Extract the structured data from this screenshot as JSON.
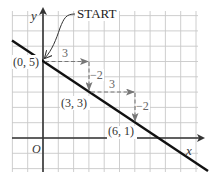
{
  "diagram": {
    "type": "coordinate-plane-slope",
    "axes": {
      "x_label": "x",
      "y_label": "y",
      "origin_label": "O"
    },
    "grid": {
      "unit_px": 15.3,
      "origin_px": [
        43,
        138
      ],
      "x_range": [
        -2,
        10
      ],
      "y_range": [
        -2,
        8
      ]
    },
    "line": {
      "slope": "-2/3",
      "y_intercept": 5,
      "color": "#111111"
    },
    "start_label": "START",
    "points": [
      {
        "label": "(0, 5)",
        "x": 0,
        "y": 5
      },
      {
        "label": "(3, 3)",
        "x": 3,
        "y": 3
      },
      {
        "label": "(6, 1)",
        "x": 6,
        "y": 1
      }
    ],
    "steps": [
      {
        "type": "run",
        "label": "3",
        "from": [
          0,
          5
        ],
        "to": [
          3,
          5
        ]
      },
      {
        "type": "rise",
        "label": "−2",
        "from": [
          3,
          5
        ],
        "to": [
          3,
          3
        ]
      },
      {
        "type": "run",
        "label": "3",
        "from": [
          3,
          3
        ],
        "to": [
          6,
          3
        ]
      },
      {
        "type": "rise",
        "label": "−2",
        "from": [
          6,
          3
        ],
        "to": [
          6,
          1
        ]
      }
    ],
    "colors": {
      "grid": "#c8c8c8",
      "axis": "#333333",
      "line": "#111111",
      "step_arrow": "#777777",
      "label": "#333333",
      "step_label": "#666666"
    }
  }
}
